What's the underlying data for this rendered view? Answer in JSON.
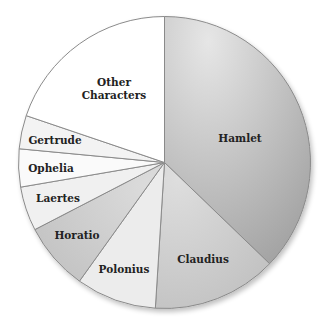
{
  "chart_data": {
    "type": "pie",
    "title": "",
    "start_angle_deg": 0,
    "direction": "clockwise",
    "categories": [
      "Hamlet",
      "Claudius",
      "Polonius",
      "Horatio",
      "Laertes",
      "Ophelia",
      "Gertrude",
      "Other Characters"
    ],
    "values": [
      37.2,
      13.8,
      8.9,
      7.5,
      4.9,
      4.2,
      3.7,
      19.8
    ],
    "unit": "percent (estimated share of lines)",
    "slices": [
      {
        "label": "Hamlet",
        "value": 37.2,
        "color": "#bdbdbd",
        "label_pos": [
          240,
          138
        ]
      },
      {
        "label": "Claudius",
        "value": 13.8,
        "color": "#d2d2d2",
        "label_pos": [
          203,
          259
        ]
      },
      {
        "label": "Polonius",
        "value": 8.9,
        "color": "#ececec",
        "label_pos": [
          124,
          269
        ]
      },
      {
        "label": "Horatio",
        "value": 7.5,
        "color": "#cfcfcf",
        "label_pos": [
          77,
          235
        ]
      },
      {
        "label": "Laertes",
        "value": 4.9,
        "color": "#f0f0f0",
        "label_pos": [
          58,
          198
        ]
      },
      {
        "label": "Ophelia",
        "value": 4.2,
        "color": "#fafafa",
        "label_pos": [
          51,
          168
        ]
      },
      {
        "label": "Gertrude",
        "value": 3.7,
        "color": "#f3f3f3",
        "label_pos": [
          55,
          140
        ]
      },
      {
        "label": "Other Characters",
        "value": 19.8,
        "color": "#ffffff",
        "label_pos": [
          114,
          86
        ],
        "multiline": [
          "Other",
          "Characters"
        ]
      }
    ],
    "legend": "none (labels on slices)",
    "center": [
      164.5,
      162.5
    ],
    "radius": 146
  },
  "colors": {
    "outline": "#8a8a8a",
    "label_text": "#222222",
    "background": "#ffffff"
  }
}
